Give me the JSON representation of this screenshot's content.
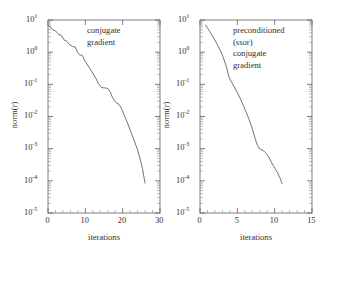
{
  "chart_data": [
    {
      "type": "line",
      "panel": "left",
      "title": "",
      "annotation_lines": [
        "conjugate",
        "gradient"
      ],
      "xlabel": "iterations",
      "ylabel": "norm(r)",
      "xlim": [
        0,
        30
      ],
      "ylim": [
        1e-05,
        10
      ],
      "yscale": "log",
      "xticks": [
        0,
        10,
        20,
        30
      ],
      "xticklabels": [
        "0",
        "10",
        "20",
        "30"
      ],
      "yticks": [
        10,
        1,
        0.1,
        0.01,
        0.001,
        0.0001,
        1e-05
      ],
      "yticklabels": [
        "10",
        "10",
        "10",
        "10",
        "10",
        "10",
        "10"
      ],
      "yticklabel_exponents": [
        "1",
        "0",
        "-1",
        "-2",
        "-3",
        "-4",
        "-5"
      ],
      "grid": false,
      "legend": "none",
      "series": [
        {
          "name": "conjugate gradient",
          "x": [
            0,
            0.6,
            1.2,
            2.0,
            2.8,
            3.5,
            4.3,
            5.0,
            5.8,
            6.6,
            7.3,
            8.0,
            8.6,
            9.2,
            9.9,
            10.6,
            11.3,
            12.0,
            12.8,
            13.5,
            14.2,
            14.8,
            15.4,
            16.0,
            16.6,
            17.2,
            17.8,
            18.4,
            19.0,
            19.7,
            20.4,
            21.1,
            21.8,
            22.5,
            23.2,
            23.9,
            24.6,
            25.3,
            26.0
          ],
          "y": [
            7.0,
            6.2,
            5.0,
            4.6,
            3.6,
            3.4,
            2.4,
            2.2,
            1.7,
            1.5,
            1.45,
            0.95,
            0.82,
            0.8,
            0.52,
            0.4,
            0.3,
            0.22,
            0.155,
            0.105,
            0.082,
            0.078,
            0.077,
            0.074,
            0.06,
            0.041,
            0.031,
            0.026,
            0.024,
            0.0175,
            0.011,
            0.0072,
            0.0044,
            0.0027,
            0.00165,
            0.00098,
            0.00052,
            0.00024,
            8.5e-05
          ]
        }
      ]
    },
    {
      "type": "line",
      "panel": "right",
      "title": "",
      "annotation_lines": [
        "preconditioned",
        "(ssor)",
        "conjugate",
        "gradient"
      ],
      "xlabel": "iterations",
      "ylabel": "norm(r)",
      "xlim": [
        0,
        15
      ],
      "ylim": [
        1e-05,
        10
      ],
      "yscale": "log",
      "xticks": [
        0,
        5,
        10,
        15
      ],
      "xticklabels": [
        "0",
        "5",
        "10",
        "15"
      ],
      "yticks": [
        10,
        1,
        0.1,
        0.01,
        0.001,
        0.0001,
        1e-05
      ],
      "yticklabels": [
        "10",
        "10",
        "10",
        "10",
        "10",
        "10",
        "10"
      ],
      "yticklabel_exponents": [
        "1",
        "0",
        "-1",
        "-2",
        "-3",
        "-4",
        "-5"
      ],
      "grid": false,
      "legend": "none",
      "series": [
        {
          "name": "preconditioned (ssor) conjugate gradient",
          "x": [
            0.75,
            1.1,
            1.5,
            1.9,
            2.3,
            2.7,
            3.1,
            3.5,
            3.9,
            4.2,
            4.6,
            5.0,
            5.4,
            5.8,
            6.2,
            6.6,
            7.0,
            7.35,
            7.7,
            8.0,
            8.3,
            8.6,
            8.9,
            9.2,
            9.5,
            9.8,
            10.1,
            10.4,
            10.7,
            11.0
          ],
          "y": [
            7.0,
            5.2,
            3.7,
            2.6,
            1.75,
            1.15,
            0.7,
            0.38,
            0.165,
            0.12,
            0.082,
            0.055,
            0.036,
            0.022,
            0.0135,
            0.0078,
            0.0042,
            0.0022,
            0.00125,
            0.00098,
            0.00092,
            0.00083,
            0.0007,
            0.00055,
            0.0004,
            0.0003,
            0.00023,
            0.00018,
            0.000125,
            8.2e-05
          ]
        }
      ]
    }
  ],
  "figure": {
    "background_color": "#ffffff",
    "line_color": "#6a6a6a",
    "axis_color": "#6e6e6e",
    "text_color": "#2f2f2f"
  }
}
